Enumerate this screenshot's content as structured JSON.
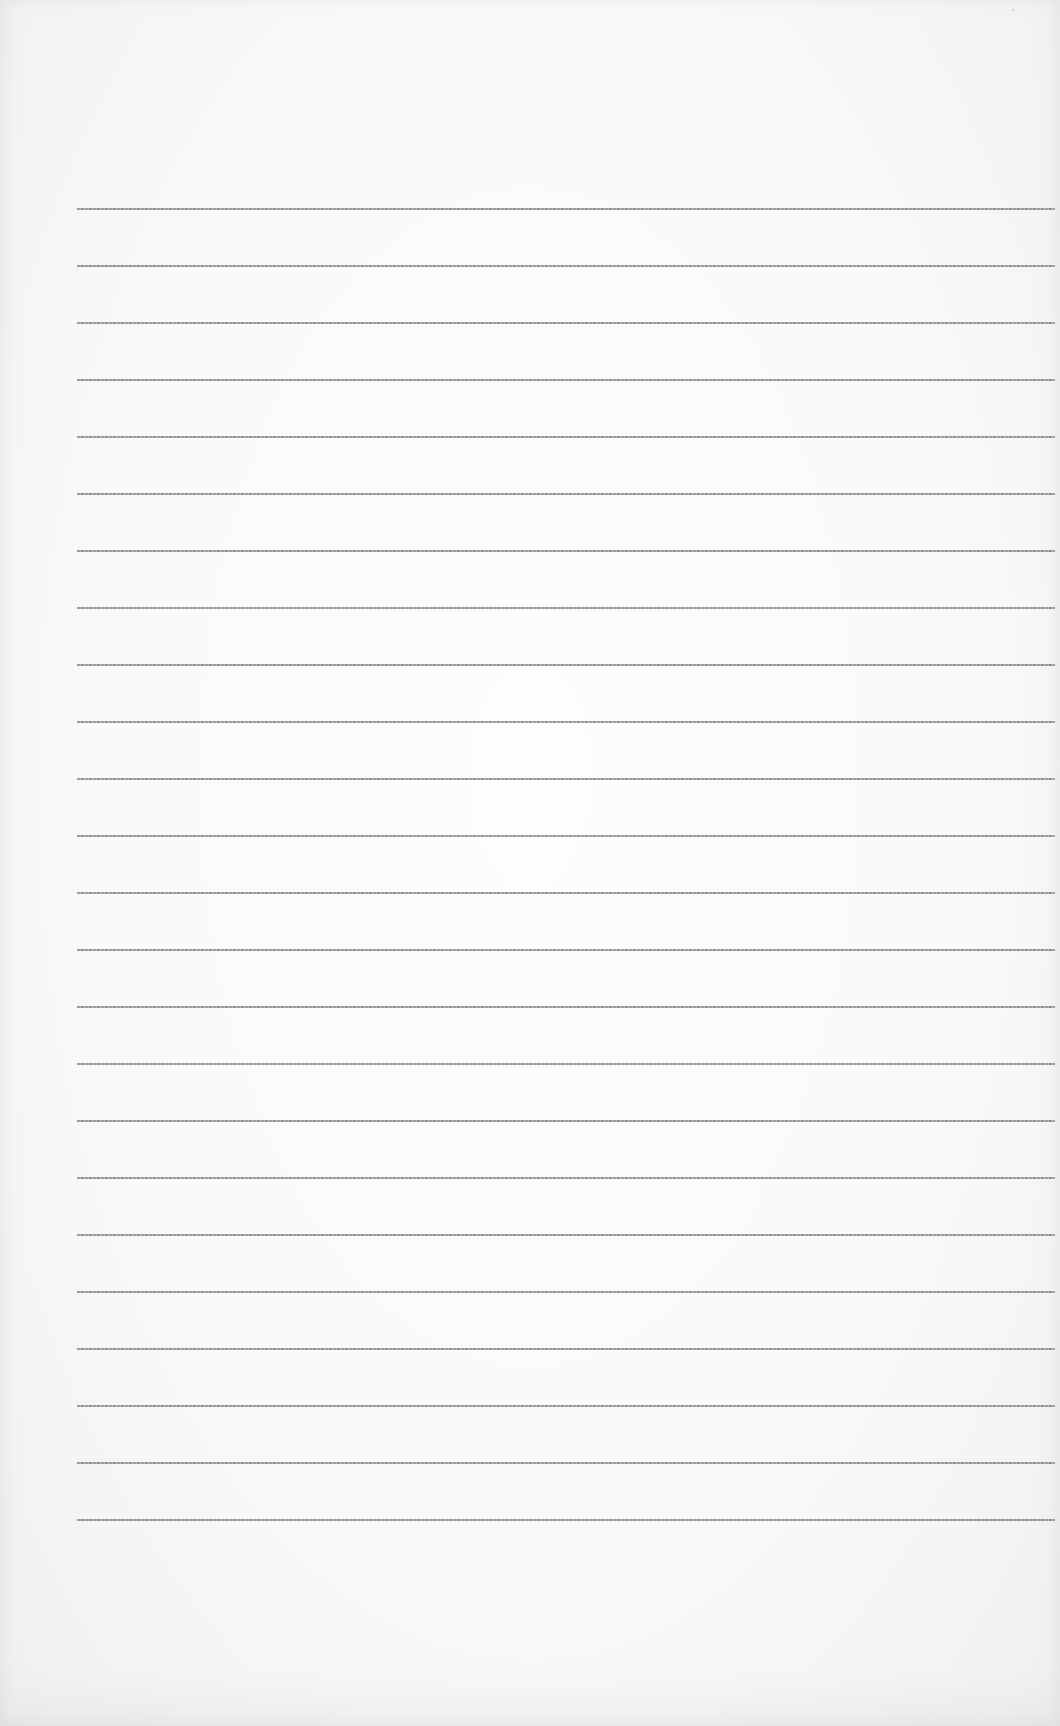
{
  "document": {
    "type": "lined-paper",
    "background_color": "#f9f9f9",
    "rule_color": "#8c8c8c",
    "rules": {
      "count": 24,
      "first_y": 208,
      "spacing": 57,
      "left": 77,
      "right": 1055
    },
    "lines_text": [
      "",
      "",
      "",
      "",
      "",
      "",
      "",
      "",
      "",
      "",
      "",
      "",
      "",
      "",
      "",
      "",
      "",
      "",
      "",
      "",
      "",
      "",
      "",
      ""
    ]
  }
}
